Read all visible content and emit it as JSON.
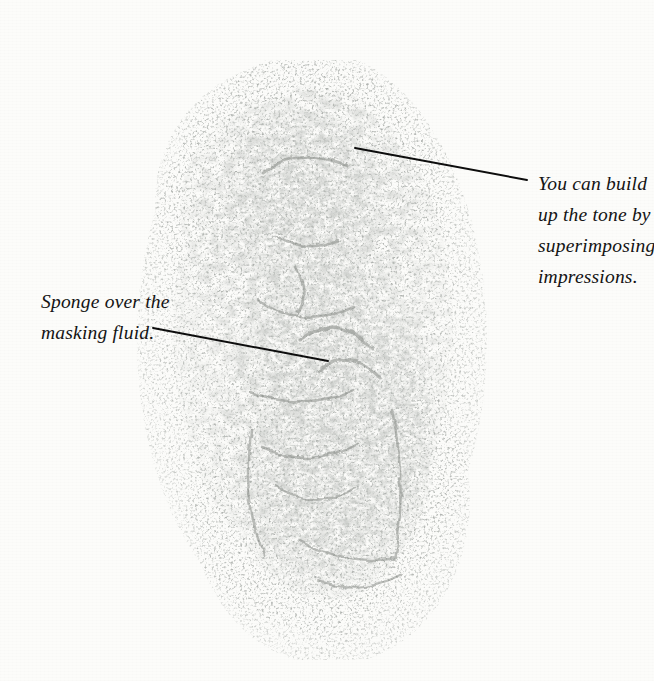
{
  "page": {
    "background_color": "#fcfcfa",
    "ink_color": "#141414",
    "artwork_tone_color": "#8d918c",
    "width": 654,
    "height": 681
  },
  "artwork": {
    "name": "sponged-watercolor-impression",
    "description": "Mottled grey sponge-printed tonal study of a seated figure, built from superimposed sponge impressions over masking fluid, speckled edges fading into white paper.",
    "bounds": {
      "x": 150,
      "y": 90,
      "width": 330,
      "height": 545
    }
  },
  "annotations": [
    {
      "id": "annotation-superimposing",
      "side": "right",
      "lines": [
        "You can build",
        "up the tone by",
        "superimposing",
        "impressions."
      ],
      "text": "You can build up the tone by superimposing impressions.",
      "leader_line": {
        "x1": 355,
        "y1": 148,
        "x2": 527,
        "y2": 180
      }
    },
    {
      "id": "annotation-sponge",
      "side": "left",
      "lines": [
        "Sponge over the",
        "masking fluid."
      ],
      "text": "Sponge over the masking fluid.",
      "leader_line": {
        "x1": 153,
        "y1": 328,
        "x2": 328,
        "y2": 361
      }
    }
  ]
}
